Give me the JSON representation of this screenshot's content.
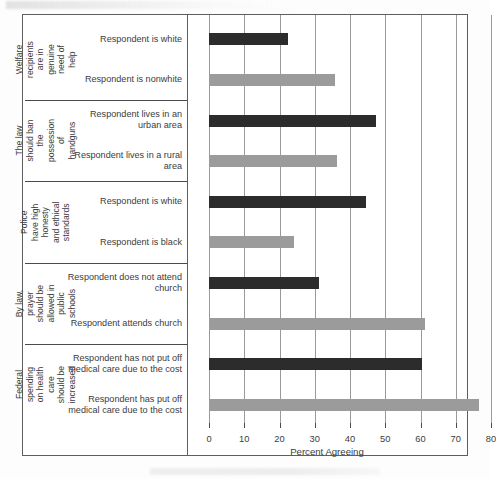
{
  "figure": {
    "background_color": "#ffffff",
    "frame_color": "#5e5e5e",
    "dark_bar_color": "#2c2c2c",
    "light_bar_color": "#9b9b9b"
  },
  "chart_data": {
    "type": "bar",
    "orientation": "horizontal",
    "title": "",
    "xlabel": "Percent Agreeing",
    "ylabel": "",
    "xlim": [
      0,
      80
    ],
    "xticks": [
      0,
      10,
      20,
      30,
      40,
      50,
      60,
      70,
      80
    ],
    "xticklabels": [
      "0",
      "10",
      "20",
      "30",
      "40",
      "50",
      "60",
      "70",
      "80"
    ],
    "grid": true,
    "grid_axis": "x",
    "legend": "none",
    "groups": [
      {
        "group_label": "Welfare recipients are in genuine need of help",
        "bars": [
          {
            "label": "Respondent is white",
            "value": 22.3,
            "color": "#2c2c2c",
            "style": "dark"
          },
          {
            "label": "Respondent is nonwhite",
            "value": 35.7,
            "color": "#9b9b9b",
            "style": "light"
          }
        ]
      },
      {
        "group_label": "The law should ban the possession of handguns",
        "bars": [
          {
            "label": "Respondent lives in an urban area",
            "value": 47.5,
            "color": "#2c2c2c",
            "style": "dark"
          },
          {
            "label": "Respondent lives in a rural area",
            "value": 36.3,
            "color": "#9b9b9b",
            "style": "light"
          }
        ]
      },
      {
        "group_label": "Police have high honesty and ethical standards",
        "bars": [
          {
            "label": "Respondent is white",
            "value": 44.5,
            "color": "#2c2c2c",
            "style": "dark"
          },
          {
            "label": "Respondent is black",
            "value": 24.1,
            "color": "#9b9b9b",
            "style": "light"
          }
        ]
      },
      {
        "group_label": "By law, prayer should be allowed in public schools",
        "bars": [
          {
            "label": "Respondent does not attend church",
            "value": 31.1,
            "color": "#2c2c2c",
            "style": "dark"
          },
          {
            "label": "Respondent attends church",
            "value": 61.4,
            "color": "#9b9b9b",
            "style": "light"
          }
        ]
      },
      {
        "group_label": "Federal spending on health care should be increased",
        "bars": [
          {
            "label": "Respondent has not put off medical care due to the cost",
            "value": 60.3,
            "color": "#2c2c2c",
            "style": "dark"
          },
          {
            "label": "Respondent has put off medical care due to the cost",
            "value": 76.5,
            "color": "#9b9b9b",
            "style": "light"
          }
        ]
      }
    ]
  }
}
